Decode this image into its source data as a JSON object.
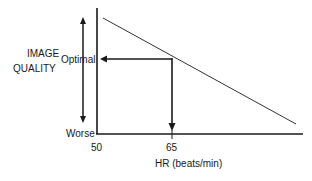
{
  "diagram": {
    "y_axis_label_line1": "IMAGE",
    "y_axis_label_line2": "QUALITY",
    "y_top_label": "Optimal",
    "y_bottom_label": "Worse",
    "x_axis_label": "HR (beats/min)",
    "x_tick_start": "50",
    "x_tick_marker": "65",
    "relationship": "Image quality decreases linearly as heart rate increases; optimal quality at HR ≤ 65 beats/min"
  },
  "colors": {
    "line": "#1a1a1a",
    "trend_line": "#333333",
    "background": "#ffffff"
  }
}
